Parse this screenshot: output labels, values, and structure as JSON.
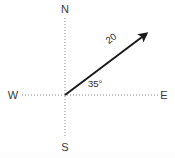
{
  "diagram": {
    "type": "vector-compass-diagram",
    "background_color": "#ffffff",
    "width": 175,
    "height": 158,
    "origin": {
      "x": 65,
      "y": 95
    },
    "compass": {
      "north_label": "N",
      "south_label": "S",
      "east_label": "E",
      "west_label": "W",
      "axis_style": "dotted",
      "axis_color": "#8c8c8c",
      "label_color": "#3a3a3a",
      "vertical_axis": {
        "x": 65,
        "y_top": 18,
        "y_bottom": 138
      },
      "horizontal_axis": {
        "y": 95,
        "x_left": 22,
        "x_right": 158
      },
      "label_positions": {
        "north": {
          "x": 65,
          "y": 13
        },
        "south": {
          "x": 65,
          "y": 149
        },
        "west": {
          "x": 13,
          "y": 99
        },
        "east": {
          "x": 163,
          "y": 99
        }
      }
    },
    "vector": {
      "magnitude_label": "20",
      "angle_label": "35°",
      "angle_degrees": 35,
      "angle_reference": "east",
      "color": "#1a1a1a",
      "stroke_width": 2,
      "tail": {
        "x": 65,
        "y": 95
      },
      "head": {
        "x": 150,
        "y": 31
      },
      "arrowhead": "filled-triangle",
      "magnitude_label_position": {
        "x": 112,
        "y": 40
      },
      "magnitude_label_rotation": -37,
      "angle_label_position": {
        "x": 88,
        "y": 86
      }
    }
  }
}
